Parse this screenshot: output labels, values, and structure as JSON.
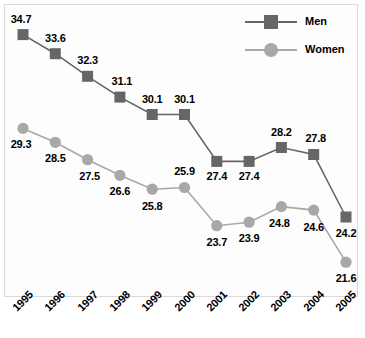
{
  "chart_data": {
    "type": "line",
    "title": "",
    "subtitle": "",
    "xlabel": "",
    "ylabel": "",
    "grid": false,
    "legend_position": "top-right",
    "categories": [
      "1995",
      "1996",
      "1997",
      "1998",
      "1999",
      "2000",
      "2001",
      "2002",
      "2003",
      "2004",
      "2005"
    ],
    "ylim": [
      20.0,
      36.0
    ],
    "series": [
      {
        "name": "Men",
        "color": "#666666",
        "marker": "square",
        "values": [
          34.7,
          33.6,
          32.3,
          31.1,
          30.1,
          30.1,
          27.4,
          27.4,
          28.2,
          27.8,
          24.2
        ],
        "labels": [
          "34.7",
          "33.6",
          "32.3",
          "31.1",
          "30.1",
          "30.1",
          "27.4",
          "27.4",
          "28.2",
          "27.8",
          "24.2"
        ]
      },
      {
        "name": "Women",
        "color": "#a8a8a8",
        "marker": "circle",
        "values": [
          29.3,
          28.5,
          27.5,
          26.6,
          25.8,
          25.9,
          23.7,
          23.9,
          24.8,
          24.6,
          21.6
        ],
        "labels": [
          "29.3",
          "28.5",
          "27.5",
          "26.6",
          "25.8",
          "25.9",
          "23.7",
          "23.9",
          "24.8",
          "24.6",
          "21.6"
        ]
      }
    ]
  },
  "legend": {
    "items": [
      {
        "label": "Men",
        "color": "#666666",
        "marker": "square"
      },
      {
        "label": "Women",
        "color": "#a8a8a8",
        "marker": "circle"
      }
    ]
  },
  "colors": {
    "men": "#666666",
    "women": "#a8a8a8",
    "label_text": "#000000",
    "plot_border": "#d9d9d9",
    "plot_background": "#fdfdfd"
  }
}
